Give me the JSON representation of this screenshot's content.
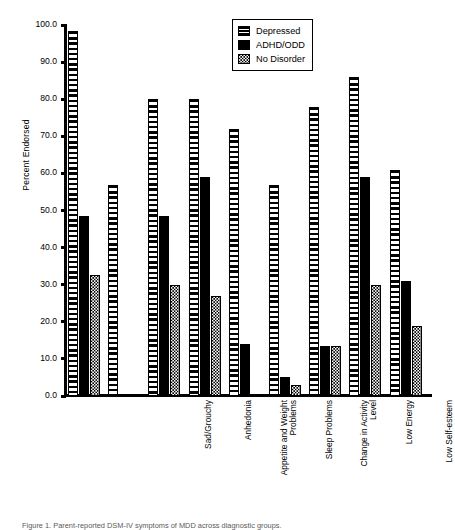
{
  "chart_data": {
    "type": "bar",
    "title": "",
    "xlabel": "",
    "ylabel": "Percent Endorsed",
    "ylim": [
      0.0,
      100.0
    ],
    "ytick_step": 10.0,
    "grid": false,
    "legend_position": "top-center",
    "categories": [
      "Sad/Grouchy",
      "Anhedonia",
      "Appetite and Weight\nProblems",
      "Sleep Problems",
      "Change in Activity\nLevel",
      "Low Energy",
      "Low Self-esteem",
      "Trouble\nThinking/Concentrating",
      "Death or Suicide\nPlay/Talk"
    ],
    "ytick_labels": [
      "0.0",
      "10.0",
      "20.0",
      "30.0",
      "40.0",
      "50.0",
      "60.0",
      "70.0",
      "80.0",
      "90.0",
      "100.0"
    ],
    "ytick_values": [
      0,
      10,
      20,
      30,
      40,
      50,
      60,
      70,
      80,
      90,
      100
    ],
    "series": [
      {
        "name": "Depressed",
        "pattern": "horizontal-stripes",
        "values": [
          98.5,
          57.0,
          80.0,
          80.0,
          72.0,
          57.0,
          78.0,
          86.0,
          61.0
        ]
      },
      {
        "name": "ADHD/ODD",
        "pattern": "solid-black",
        "values": [
          48.5,
          0.0,
          48.5,
          59.0,
          14.0,
          5.0,
          13.5,
          59.0,
          31.0
        ]
      },
      {
        "name": "No Disorder",
        "pattern": "dotted",
        "values": [
          32.5,
          0.0,
          30.0,
          27.0,
          0.0,
          3.0,
          13.5,
          30.0,
          19.0
        ]
      }
    ]
  },
  "legend": {
    "items": [
      {
        "label": "Depressed"
      },
      {
        "label": "ADHD/ODD"
      },
      {
        "label": "No Disorder"
      }
    ]
  },
  "caption": {
    "text": "Figure 1. Parent-reported DSM-IV symptoms of MDD across diagnostic groups."
  }
}
